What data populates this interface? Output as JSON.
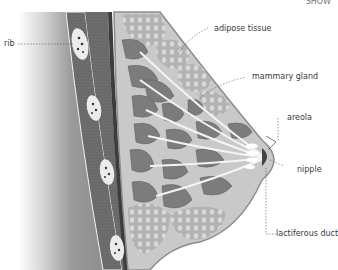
{
  "diagram": {
    "corner_text": "SHOW",
    "labels": [
      {
        "id": "rib",
        "text": "rib"
      },
      {
        "id": "adipose",
        "text": "adipose tissue"
      },
      {
        "id": "gland",
        "text": "mammary gland"
      },
      {
        "id": "areola",
        "text": "areola"
      },
      {
        "id": "nipple",
        "text": "nipple"
      },
      {
        "id": "duct",
        "text": "lactiferous duct"
      }
    ],
    "colors": {
      "chest_gradient_dark": "#8a8a8a",
      "chest_gradient_light": "#ffffff",
      "muscle": "#6f6f6f",
      "rib": "#e8e8e8",
      "breast_bg": "#c9c9c9",
      "adipose": "#b5b5b5",
      "gland_lobes": "#7c7c7c",
      "ducts": "#f4f4f4",
      "skin_line": "#8d8d8d",
      "label_text": "#3a3a3a"
    }
  }
}
